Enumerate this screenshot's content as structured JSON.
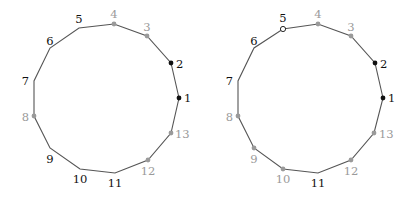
{
  "colors": {
    "edge": "#555555",
    "black": "#111111",
    "gray": "#9a9a9a",
    "hollow_fill": "#ffffff"
  },
  "diagrams": [
    {
      "name": "left-polygon",
      "offset_x": 0,
      "vertices": [
        {
          "label": "1",
          "x": 179,
          "y": 98,
          "dot": "black",
          "text": "black",
          "lx": 184,
          "ly": 102,
          "anchor": "start"
        },
        {
          "label": "2",
          "x": 171,
          "y": 63,
          "dot": "black",
          "text": "black",
          "lx": 176,
          "ly": 68,
          "anchor": "start"
        },
        {
          "label": "3",
          "x": 147,
          "y": 36,
          "dot": "gray",
          "text": "gray",
          "lx": 147,
          "ly": 31,
          "anchor": "middle"
        },
        {
          "label": "4",
          "x": 114,
          "y": 24,
          "dot": "gray",
          "text": "gray",
          "lx": 114,
          "ly": 18,
          "anchor": "middle"
        },
        {
          "label": "5",
          "x": 79,
          "y": 28,
          "dot": "none",
          "text": "black",
          "lx": 79,
          "ly": 23,
          "anchor": "middle"
        },
        {
          "label": "6",
          "x": 50,
          "y": 48,
          "dot": "none",
          "text": "black",
          "lx": 50,
          "ly": 45,
          "anchor": "middle"
        },
        {
          "label": "7",
          "x": 34,
          "y": 81,
          "dot": "none",
          "text": "black",
          "lx": 29,
          "ly": 85,
          "anchor": "end"
        },
        {
          "label": "8",
          "x": 34,
          "y": 116,
          "dot": "gray",
          "text": "gray",
          "lx": 29,
          "ly": 121,
          "anchor": "end"
        },
        {
          "label": "9",
          "x": 50,
          "y": 148,
          "dot": "none",
          "text": "black",
          "lx": 50,
          "ly": 163,
          "anchor": "middle"
        },
        {
          "label": "10",
          "x": 80,
          "y": 169,
          "dot": "none",
          "text": "black",
          "lx": 80,
          "ly": 183,
          "anchor": "middle"
        },
        {
          "label": "11",
          "x": 115,
          "y": 173,
          "dot": "none",
          "text": "black",
          "lx": 115,
          "ly": 187,
          "anchor": "middle"
        },
        {
          "label": "12",
          "x": 148,
          "y": 160,
          "dot": "gray",
          "text": "gray",
          "lx": 148,
          "ly": 175,
          "anchor": "middle"
        },
        {
          "label": "13",
          "x": 171,
          "y": 133,
          "dot": "gray",
          "text": "gray",
          "lx": 175,
          "ly": 138,
          "anchor": "start"
        }
      ]
    },
    {
      "name": "right-polygon",
      "offset_x": 204,
      "vertices": [
        {
          "label": "1",
          "x": 179,
          "y": 98,
          "dot": "black",
          "text": "black",
          "lx": 184,
          "ly": 102,
          "anchor": "start"
        },
        {
          "label": "2",
          "x": 171,
          "y": 63,
          "dot": "black",
          "text": "black",
          "lx": 176,
          "ly": 68,
          "anchor": "start"
        },
        {
          "label": "3",
          "x": 147,
          "y": 36,
          "dot": "gray",
          "text": "gray",
          "lx": 147,
          "ly": 31,
          "anchor": "middle"
        },
        {
          "label": "4",
          "x": 114,
          "y": 24,
          "dot": "gray",
          "text": "gray",
          "lx": 114,
          "ly": 18,
          "anchor": "middle"
        },
        {
          "label": "5",
          "x": 79,
          "y": 29,
          "dot": "hollow",
          "text": "black",
          "lx": 79,
          "ly": 22,
          "anchor": "middle"
        },
        {
          "label": "6",
          "x": 50,
          "y": 48,
          "dot": "none",
          "text": "black",
          "lx": 50,
          "ly": 45,
          "anchor": "middle"
        },
        {
          "label": "7",
          "x": 34,
          "y": 81,
          "dot": "none",
          "text": "black",
          "lx": 29,
          "ly": 85,
          "anchor": "end"
        },
        {
          "label": "8",
          "x": 34,
          "y": 116,
          "dot": "gray",
          "text": "gray",
          "lx": 29,
          "ly": 121,
          "anchor": "end"
        },
        {
          "label": "9",
          "x": 50,
          "y": 148,
          "dot": "gray",
          "text": "gray",
          "lx": 50,
          "ly": 163,
          "anchor": "middle"
        },
        {
          "label": "10",
          "x": 79,
          "y": 169,
          "dot": "gray",
          "text": "gray",
          "lx": 79,
          "ly": 183,
          "anchor": "middle"
        },
        {
          "label": "11",
          "x": 114,
          "y": 173,
          "dot": "none",
          "text": "black",
          "lx": 114,
          "ly": 187,
          "anchor": "middle"
        },
        {
          "label": "12",
          "x": 147,
          "y": 160,
          "dot": "gray",
          "text": "gray",
          "lx": 147,
          "ly": 175,
          "anchor": "middle"
        },
        {
          "label": "13",
          "x": 170,
          "y": 133,
          "dot": "gray",
          "text": "gray",
          "lx": 175,
          "ly": 138,
          "anchor": "start"
        }
      ]
    }
  ]
}
